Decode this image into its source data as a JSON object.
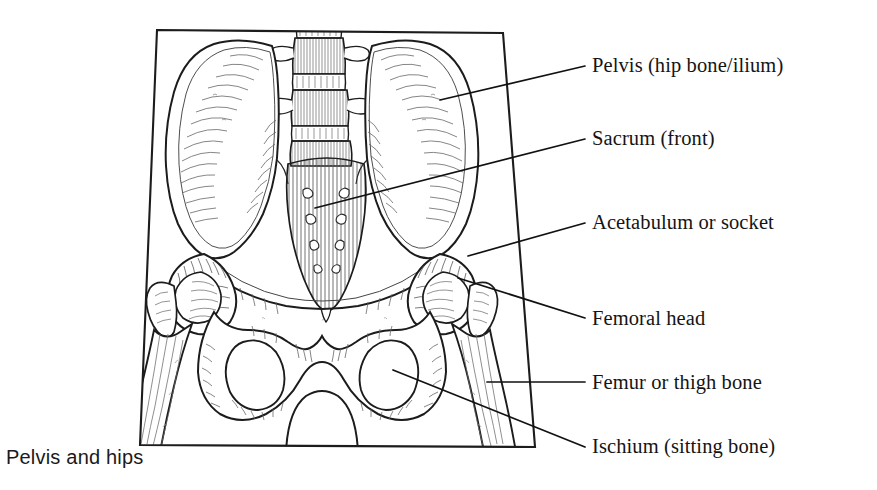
{
  "figure": {
    "caption": "Pelvis and hips",
    "style": "pen-and-ink line drawing with hatching",
    "colors": {
      "ink": "#1a1a1a",
      "hatch": "#555555",
      "background": "#ffffff",
      "leader": "#111111"
    },
    "frame": {
      "name": "illustration-border",
      "top_left": [
        157,
        30
      ],
      "top_right": [
        503,
        33
      ],
      "bottom_right": [
        535,
        447
      ],
      "bottom_left": [
        140,
        445
      ]
    }
  },
  "labels": [
    {
      "id": "pelvis",
      "text": "Pelvis (hip bone/ilium)",
      "x": 592,
      "y": 55,
      "leader": {
        "x1": 440,
        "y1": 100,
        "x2": 585,
        "y2": 66
      }
    },
    {
      "id": "sacrum",
      "text": "Sacrum (front)",
      "x": 592,
      "y": 128,
      "leader": {
        "x1": 315,
        "y1": 208,
        "x2": 585,
        "y2": 139
      }
    },
    {
      "id": "acetabulum",
      "text": "Acetabulum or socket",
      "x": 592,
      "y": 212,
      "leader": {
        "x1": 468,
        "y1": 256,
        "x2": 585,
        "y2": 223
      }
    },
    {
      "id": "femoral-head",
      "text": "Femoral head",
      "x": 592,
      "y": 308,
      "leader": {
        "x1": 458,
        "y1": 278,
        "x2": 585,
        "y2": 318
      }
    },
    {
      "id": "femur",
      "text": "Femur or thigh bone",
      "x": 592,
      "y": 372,
      "leader": {
        "x1": 487,
        "y1": 382,
        "x2": 585,
        "y2": 382
      }
    },
    {
      "id": "ischium",
      "text": "Ischium (sitting bone)",
      "x": 592,
      "y": 436,
      "leader": {
        "x1": 393,
        "y1": 370,
        "x2": 585,
        "y2": 447
      }
    }
  ],
  "anatomy_parts": [
    {
      "name": "lumbar-vertebrae",
      "note": "stacked vertebral bodies with transverse processes at top center"
    },
    {
      "name": "sacrum",
      "note": "triangular tapering bone with paired sacral foramina"
    },
    {
      "name": "ilium-left",
      "note": "large fan-shaped wing, viewer left"
    },
    {
      "name": "ilium-right",
      "note": "large fan-shaped wing, viewer right"
    },
    {
      "name": "acetabulum-left",
      "note": "hip socket, viewer left"
    },
    {
      "name": "acetabulum-right",
      "note": "hip socket, viewer right"
    },
    {
      "name": "femoral-head-left",
      "note": "ball of femur seated in left socket"
    },
    {
      "name": "femoral-head-right",
      "note": "ball of femur seated in right socket"
    },
    {
      "name": "femur-shaft-left",
      "note": "thigh bone shaft descending, viewer left"
    },
    {
      "name": "femur-shaft-right",
      "note": "thigh bone shaft descending, viewer right"
    },
    {
      "name": "obturator-foramen-left",
      "note": "oval opening below left socket"
    },
    {
      "name": "obturator-foramen-right",
      "note": "oval opening below right socket"
    },
    {
      "name": "pubic-symphysis",
      "note": "central joint between pubic bones"
    },
    {
      "name": "pubic-arch",
      "note": "inverted-U arch at bottom center"
    },
    {
      "name": "ischium-left",
      "note": "sitting bone, viewer left"
    },
    {
      "name": "ischium-right",
      "note": "sitting bone, viewer right"
    }
  ]
}
